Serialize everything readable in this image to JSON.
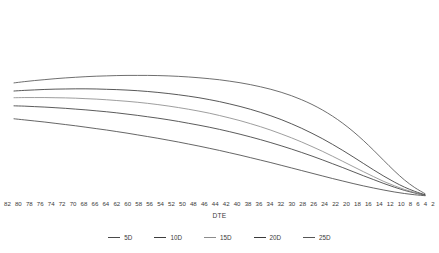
{
  "chart_data": {
    "type": "line",
    "title": "",
    "xlabel": "DTE",
    "ylabel": "",
    "grid": false,
    "legend_position": "bottom",
    "x_axis_direction": "descending",
    "categories": [
      82,
      80,
      78,
      76,
      74,
      72,
      70,
      68,
      66,
      64,
      62,
      60,
      58,
      56,
      54,
      52,
      50,
      48,
      46,
      44,
      42,
      40,
      38,
      36,
      34,
      32,
      30,
      28,
      26,
      24,
      22,
      20,
      18,
      16,
      14,
      12,
      10,
      8,
      6,
      4,
      2
    ],
    "xlim": [
      82,
      2
    ],
    "ylim": [
      0,
      100
    ],
    "series": [
      {
        "name": "5D",
        "color": "#4a4a4a",
        "values": [
          49.5,
          48.8,
          48.1,
          47.4,
          46.6,
          45.8,
          45.0,
          44.1,
          43.2,
          42.3,
          41.3,
          40.3,
          39.2,
          38.1,
          37.0,
          35.8,
          34.6,
          33.3,
          32.0,
          30.6,
          29.2,
          27.7,
          26.2,
          24.6,
          23.0,
          21.4,
          19.7,
          18.0,
          16.3,
          14.6,
          12.9,
          11.2,
          9.6,
          8.0,
          6.5,
          5.1,
          3.8,
          2.6,
          1.6,
          0.8,
          0.2
        ]
      },
      {
        "name": "10D",
        "color": "#3d3d3d",
        "values": [
          57.8,
          57.6,
          57.3,
          57.0,
          56.6,
          56.2,
          55.7,
          55.2,
          54.6,
          54.0,
          53.3,
          52.5,
          51.7,
          50.8,
          49.9,
          48.9,
          47.8,
          46.6,
          45.4,
          44.1,
          42.7,
          41.2,
          39.6,
          37.9,
          36.1,
          34.2,
          32.2,
          30.1,
          27.9,
          25.6,
          23.2,
          20.7,
          18.2,
          15.6,
          13.0,
          10.5,
          8.0,
          5.7,
          3.6,
          1.9,
          0.5
        ]
      },
      {
        "name": "15D",
        "color": "#8c8c8c",
        "values": [
          63.0,
          63.1,
          63.1,
          63.1,
          63.0,
          62.9,
          62.7,
          62.4,
          62.1,
          61.7,
          61.2,
          60.7,
          60.1,
          59.4,
          58.6,
          57.7,
          56.7,
          55.6,
          54.4,
          53.1,
          51.6,
          50.0,
          48.3,
          46.4,
          44.4,
          42.2,
          39.8,
          37.3,
          34.6,
          31.7,
          28.7,
          25.5,
          22.2,
          18.9,
          15.6,
          12.4,
          9.3,
          6.6,
          4.2,
          2.2,
          0.6
        ]
      },
      {
        "name": "20D",
        "color": "#3a3a3a",
        "values": [
          67.3,
          67.7,
          68.0,
          68.3,
          68.5,
          68.6,
          68.7,
          68.7,
          68.6,
          68.4,
          68.2,
          67.9,
          67.5,
          67.0,
          66.4,
          65.7,
          64.9,
          64.0,
          63.0,
          61.8,
          60.5,
          59.0,
          57.4,
          55.6,
          53.6,
          51.4,
          49.0,
          46.3,
          43.4,
          40.2,
          36.8,
          33.1,
          29.2,
          25.1,
          20.9,
          16.7,
          12.7,
          9.0,
          5.7,
          3.0,
          0.8
        ]
      },
      {
        "name": "25D",
        "color": "#555555",
        "values": [
          72.5,
          73.3,
          74.0,
          74.6,
          75.2,
          75.7,
          76.1,
          76.5,
          76.8,
          77.0,
          77.2,
          77.3,
          77.3,
          77.3,
          77.2,
          77.0,
          76.7,
          76.3,
          75.8,
          75.2,
          74.5,
          73.6,
          72.6,
          71.4,
          70.0,
          68.4,
          66.5,
          64.3,
          61.7,
          58.7,
          55.2,
          51.2,
          46.6,
          41.4,
          35.6,
          29.3,
          22.7,
          16.2,
          10.3,
          5.4,
          1.5
        ]
      }
    ]
  },
  "axis": {
    "x_tick_labels": [
      "82",
      "80",
      "78",
      "76",
      "74",
      "72",
      "70",
      "68",
      "66",
      "64",
      "62",
      "60",
      "58",
      "56",
      "54",
      "52",
      "50",
      "48",
      "46",
      "44",
      "42",
      "40",
      "38",
      "36",
      "34",
      "32",
      "30",
      "28",
      "26",
      "24",
      "22",
      "20",
      "18",
      "16",
      "14",
      "12",
      "10",
      "8",
      "6",
      "4",
      "2"
    ],
    "x_title": "DTE"
  },
  "legend": {
    "items": [
      {
        "label": "5D",
        "color": "#4a4a4a"
      },
      {
        "label": "10D",
        "color": "#3d3d3d"
      },
      {
        "label": "15D",
        "color": "#8c8c8c"
      },
      {
        "label": "20D",
        "color": "#3a3a3a"
      },
      {
        "label": "25D",
        "color": "#555555"
      }
    ]
  },
  "style": {
    "background": "#ffffff",
    "text_color": "#3a3a3a"
  }
}
